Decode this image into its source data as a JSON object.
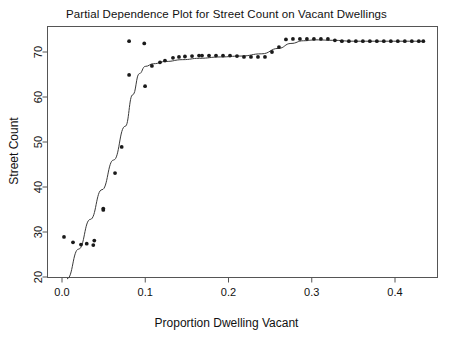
{
  "chart_data": {
    "type": "scatter",
    "title": "Partial Dependence Plot for Street Count on Vacant Dwellings",
    "xlabel": "Proportion Dwelling Vacant",
    "ylabel": "Street Count",
    "xlim": [
      -0.012,
      0.447
    ],
    "ylim": [
      18.2,
      75.0
    ],
    "xticks": [
      0.0,
      0.1,
      0.2,
      0.3,
      0.4
    ],
    "xticklabels": [
      "0.0",
      "0.1",
      "0.2",
      "0.3",
      "0.4"
    ],
    "yticks": [
      20,
      30,
      40,
      50,
      60,
      70
    ],
    "yticklabels": [
      "20",
      "30",
      "40",
      "50",
      "60",
      "70"
    ],
    "grid": false,
    "legend": null,
    "marker_color": "#1a1a1a",
    "line_color": "#3a3a3a",
    "series": [
      {
        "name": "Partial dependence points",
        "type": "scatter",
        "points": [
          [
            0.0024,
            28.9
          ],
          [
            0.0132,
            27.7
          ],
          [
            0.0228,
            27.2
          ],
          [
            0.0297,
            27.4
          ],
          [
            0.0388,
            28.1
          ],
          [
            0.0376,
            27.1
          ],
          [
            0.0496,
            34.9
          ],
          [
            0.0496,
            35.2
          ],
          [
            0.0637,
            43.1
          ],
          [
            0.0717,
            48.9
          ],
          [
            0.0806,
            72.4
          ],
          [
            0.0806,
            64.9
          ],
          [
            0.0988,
            71.9
          ],
          [
            0.0998,
            62.4
          ],
          [
            0.108,
            66.9
          ],
          [
            0.1177,
            67.7
          ],
          [
            0.1237,
            68.1
          ],
          [
            0.1333,
            68.7
          ],
          [
            0.1405,
            68.9
          ],
          [
            0.1477,
            69.0
          ],
          [
            0.1562,
            69.1
          ],
          [
            0.1646,
            69.2
          ],
          [
            0.1682,
            69.2
          ],
          [
            0.1766,
            69.2
          ],
          [
            0.185,
            69.2
          ],
          [
            0.1934,
            69.2
          ],
          [
            0.2018,
            69.2
          ],
          [
            0.2102,
            69.1
          ],
          [
            0.2186,
            68.9
          ],
          [
            0.227,
            68.9
          ],
          [
            0.2354,
            68.9
          ],
          [
            0.2438,
            68.9
          ],
          [
            0.2522,
            70.0
          ],
          [
            0.2606,
            71.1
          ],
          [
            0.269,
            72.8
          ],
          [
            0.2774,
            72.9
          ],
          [
            0.2858,
            72.9
          ],
          [
            0.2942,
            72.9
          ],
          [
            0.3026,
            72.9
          ],
          [
            0.311,
            72.9
          ],
          [
            0.3194,
            72.9
          ],
          [
            0.3278,
            72.6
          ],
          [
            0.3362,
            72.4
          ],
          [
            0.3446,
            72.4
          ],
          [
            0.353,
            72.4
          ],
          [
            0.3614,
            72.4
          ],
          [
            0.3698,
            72.4
          ],
          [
            0.3782,
            72.4
          ],
          [
            0.3866,
            72.4
          ],
          [
            0.395,
            72.4
          ],
          [
            0.4034,
            72.4
          ],
          [
            0.4118,
            72.4
          ],
          [
            0.4202,
            72.4
          ],
          [
            0.4286,
            72.4
          ],
          [
            0.434,
            72.4
          ]
        ]
      },
      {
        "name": "Smoothed fit",
        "type": "line",
        "points": [
          [
            0.006,
            19.6
          ],
          [
            0.02,
            26.2
          ],
          [
            0.034,
            32.8
          ],
          [
            0.048,
            39.4
          ],
          [
            0.062,
            46.0
          ],
          [
            0.076,
            53.5
          ],
          [
            0.085,
            60.5
          ],
          [
            0.093,
            65.2
          ],
          [
            0.1,
            66.8
          ],
          [
            0.11,
            67.4
          ],
          [
            0.125,
            67.9
          ],
          [
            0.145,
            68.3
          ],
          [
            0.165,
            68.6
          ],
          [
            0.19,
            68.9
          ],
          [
            0.215,
            69.1
          ],
          [
            0.24,
            69.6
          ],
          [
            0.26,
            70.8
          ],
          [
            0.275,
            71.9
          ],
          [
            0.29,
            72.5
          ],
          [
            0.305,
            72.7
          ],
          [
            0.325,
            72.6
          ],
          [
            0.35,
            72.4
          ],
          [
            0.38,
            72.4
          ],
          [
            0.41,
            72.4
          ],
          [
            0.434,
            72.4
          ]
        ]
      }
    ]
  }
}
